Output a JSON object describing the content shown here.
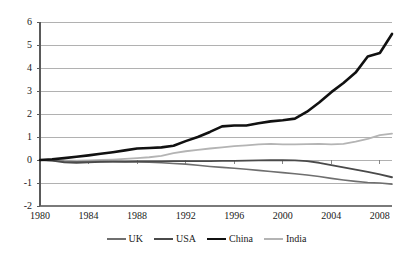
{
  "chart_data": {
    "type": "line",
    "title": "",
    "xlabel": "",
    "ylabel": "",
    "xlim": [
      1980,
      2009
    ],
    "ylim": [
      -2,
      6
    ],
    "grid": "horizontal",
    "legend_position": "bottom",
    "x_ticks": [
      "1980",
      "1984",
      "1988",
      "1992",
      "1996",
      "2000",
      "2004",
      "2008"
    ],
    "y_ticks": [
      "6",
      "5",
      "4",
      "3",
      "2",
      "1",
      "0",
      "-1",
      "-2"
    ],
    "x": [
      1980,
      1981,
      1982,
      1983,
      1984,
      1985,
      1986,
      1987,
      1988,
      1989,
      1990,
      1991,
      1992,
      1993,
      1994,
      1995,
      1996,
      1997,
      1998,
      1999,
      2000,
      2001,
      2002,
      2003,
      2004,
      2005,
      2006,
      2007,
      2008,
      2009
    ],
    "series": [
      {
        "name": "UK",
        "color": "#6f6f6f",
        "width": 1.6,
        "values": [
          0.0,
          -0.02,
          -0.06,
          -0.08,
          -0.07,
          -0.06,
          -0.07,
          -0.08,
          -0.09,
          -0.1,
          -0.12,
          -0.15,
          -0.18,
          -0.23,
          -0.28,
          -0.32,
          -0.36,
          -0.4,
          -0.45,
          -0.5,
          -0.55,
          -0.6,
          -0.65,
          -0.72,
          -0.8,
          -0.87,
          -0.93,
          -0.98,
          -1.0,
          -1.05
        ]
      },
      {
        "name": "USA",
        "color": "#4a4a4a",
        "width": 1.8,
        "values": [
          0.0,
          -0.03,
          -0.1,
          -0.12,
          -0.1,
          -0.08,
          -0.07,
          -0.07,
          -0.06,
          -0.06,
          -0.06,
          -0.05,
          -0.05,
          -0.05,
          -0.05,
          -0.04,
          -0.04,
          -0.03,
          -0.02,
          -0.01,
          -0.01,
          -0.02,
          -0.05,
          -0.12,
          -0.22,
          -0.32,
          -0.42,
          -0.52,
          -0.63,
          -0.75
        ]
      },
      {
        "name": "China",
        "color": "#111111",
        "width": 2.6,
        "values": [
          0.0,
          0.03,
          0.08,
          0.14,
          0.2,
          0.27,
          0.34,
          0.42,
          0.5,
          0.52,
          0.55,
          0.62,
          0.82,
          1.0,
          1.22,
          1.46,
          1.5,
          1.5,
          1.6,
          1.68,
          1.73,
          1.8,
          2.1,
          2.5,
          2.95,
          3.35,
          3.8,
          4.5,
          4.65,
          5.48
        ]
      },
      {
        "name": "India",
        "color": "#b4b4b4",
        "width": 1.8,
        "values": [
          0.0,
          -0.01,
          -0.03,
          -0.03,
          -0.02,
          0.0,
          0.02,
          0.05,
          0.08,
          0.12,
          0.18,
          0.3,
          0.38,
          0.44,
          0.5,
          0.55,
          0.6,
          0.64,
          0.68,
          0.7,
          0.68,
          0.68,
          0.69,
          0.7,
          0.68,
          0.7,
          0.8,
          0.92,
          1.08,
          1.15
        ]
      }
    ]
  },
  "legend": {
    "items": [
      {
        "label": "UK"
      },
      {
        "label": "USA"
      },
      {
        "label": "China"
      },
      {
        "label": "India"
      }
    ]
  }
}
